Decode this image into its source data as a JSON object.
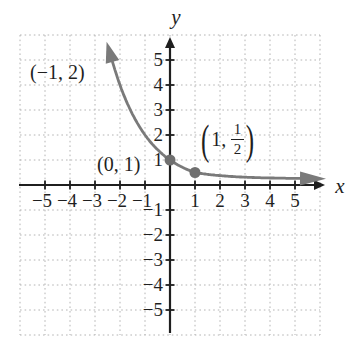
{
  "figure": {
    "background": "#ffffff",
    "axis_color": "#1f1f1f",
    "grid_color": "#b4b4b4",
    "curve_color": "#7a7a7a",
    "point_color": "#6f6f6f"
  },
  "chart_data": {
    "type": "line",
    "title": "",
    "function": "y = (1/2)^x",
    "xlabel": "x",
    "ylabel": "y",
    "xlim": [
      -6,
      6
    ],
    "ylim": [
      -6,
      6
    ],
    "grid": true,
    "x_ticks": [
      -5,
      -4,
      -3,
      -2,
      -1,
      1,
      2,
      3,
      4,
      5
    ],
    "y_ticks": [
      -5,
      -4,
      -3,
      -2,
      -1,
      1,
      2,
      3,
      4,
      5
    ],
    "x_tick_labels": [
      "−5",
      "−4",
      "−3",
      "−2",
      "−1",
      "1",
      "2",
      "3",
      "4",
      "5"
    ],
    "y_tick_labels": [
      "−5",
      "−4",
      "−3",
      "−2",
      "−1",
      "1",
      "2",
      "3",
      "4",
      "5"
    ],
    "curve_x_range": [
      -2.3,
      5.2
    ],
    "series": [
      {
        "name": "y=(1/2)^x",
        "points": [
          [
            -2,
            4
          ],
          [
            -1,
            2
          ],
          [
            0,
            1
          ],
          [
            1,
            0.5
          ],
          [
            2,
            0.25
          ],
          [
            3,
            0.125
          ]
        ]
      }
    ],
    "marked_points": [
      {
        "x": 0,
        "y": 1,
        "label": "(0, 1)"
      },
      {
        "x": 1,
        "y": 0.5,
        "label": "(1, 1/2)"
      }
    ],
    "legend": null
  },
  "labels": {
    "point_neg1_2": "(−1, 2)",
    "point_0_1": "(0, 1)",
    "point_1_half": {
      "open": "(",
      "pre": "1,",
      "num": "1",
      "den": "2",
      "close": ")"
    }
  }
}
